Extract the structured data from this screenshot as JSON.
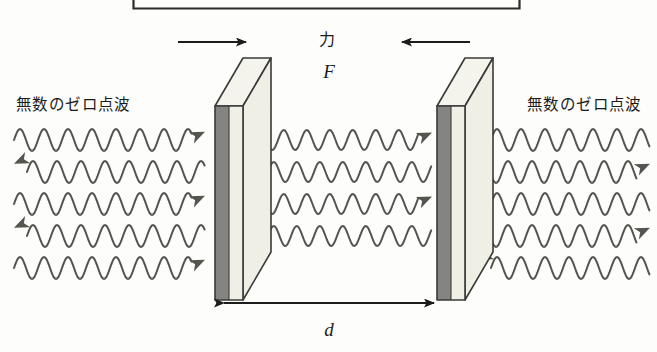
{
  "figure": {
    "title_box": {
      "name": "caption-box-cropped",
      "visible_border": true,
      "left": 133,
      "right": 520,
      "bottom_y": 9
    },
    "labels": {
      "left_wave_label": "無数のゼロ点波",
      "right_wave_label": "無数のゼロ点波",
      "force_label_jp": "力",
      "force_symbol": "F",
      "distance_symbol": "d"
    },
    "colors": {
      "stroke": "#3a3a38",
      "ink": "#1c1c1c",
      "plate_side_gray": "#848480",
      "plate_face_cream": "#efefe6",
      "plate_top_cream": "#f4f4ec",
      "wave_stroke": "#55554f",
      "background": "#fdfdfb"
    },
    "plates": [
      {
        "name": "left-plate",
        "face_x": 215,
        "face_width": 28,
        "face_top": 106,
        "face_bottom": 300,
        "depth_dx": 28,
        "depth_dy": -48,
        "side_gray_width": 14
      },
      {
        "name": "right-plate",
        "face_x": 437,
        "face_width": 28,
        "face_top": 106,
        "face_bottom": 300,
        "depth_dx": 28,
        "depth_dy": -48,
        "side_gray_width": 14
      }
    ],
    "force_arrows": [
      {
        "name": "left-force-arrow",
        "direction": "right",
        "x1": 178,
        "x2": 252,
        "y": 42
      },
      {
        "name": "right-force-arrow",
        "direction": "left",
        "x1": 470,
        "x2": 396,
        "y": 42
      }
    ],
    "dimension_line": {
      "name": "plate-separation-dimension",
      "x1": 218,
      "x2": 440,
      "y": 303,
      "double_headed": true,
      "label": "d"
    },
    "wave_groups": [
      {
        "name": "left-zero-point-waves",
        "count": 5,
        "x_start": 14,
        "x_end": 205,
        "amplitude": 11,
        "wavelength": 24,
        "rows_y": [
          140,
          172,
          204,
          236,
          268
        ],
        "arrow_sides": [
          "right",
          "left",
          "right",
          "left",
          "right"
        ]
      },
      {
        "name": "center-cavity-waves",
        "count": 4,
        "x_start": 255,
        "x_end": 432,
        "amplitude": 10,
        "wavelength": 23,
        "rows_y": [
          140,
          172,
          204,
          236
        ],
        "arrow_sides": [
          "right",
          "left",
          "right",
          "left"
        ]
      },
      {
        "name": "right-zero-point-waves",
        "count": 5,
        "x_start": 478,
        "x_end": 650,
        "amplitude": 11,
        "wavelength": 24,
        "rows_y": [
          140,
          172,
          204,
          236,
          268
        ],
        "arrow_sides": [
          "left",
          "right",
          "left",
          "right",
          "left"
        ]
      }
    ],
    "label_positions": {
      "left_wave_label": {
        "x": 16,
        "y": 110
      },
      "right_wave_label": {
        "x": 527,
        "y": 110
      },
      "force_label_jp": {
        "x": 327,
        "y": 45
      },
      "force_symbol": {
        "x": 330,
        "y": 76
      },
      "distance_symbol": {
        "x": 329,
        "y": 334
      }
    }
  }
}
